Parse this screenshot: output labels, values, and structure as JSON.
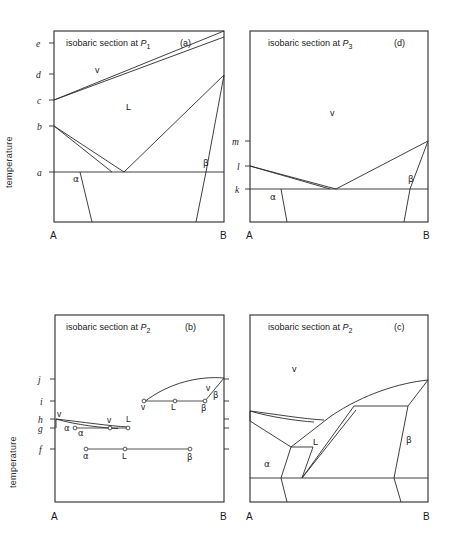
{
  "figure": {
    "axis_label": "temperature",
    "panels": [
      {
        "id": "a",
        "tag": "(a)",
        "title_prefix": "isobaric section at ",
        "title_symbol": "P",
        "title_sub": "1",
        "left_corner": "A",
        "right_corner": "B",
        "ticks": [
          "e",
          "d",
          "c",
          "b",
          "a"
        ],
        "regions": [
          {
            "name": "v"
          },
          {
            "name": "L"
          },
          {
            "name": "α"
          },
          {
            "name": "β"
          }
        ]
      },
      {
        "id": "d",
        "tag": "(d)",
        "title_prefix": "isobaric section at ",
        "title_symbol": "P",
        "title_sub": "3",
        "left_corner": "A",
        "right_corner": "B",
        "ticks": [
          "m",
          "l",
          "k"
        ],
        "regions": [
          {
            "name": "v"
          },
          {
            "name": "α"
          },
          {
            "name": "β"
          }
        ]
      },
      {
        "id": "b",
        "tag": "(b)",
        "title_prefix": "isobaric section at ",
        "title_symbol": "P",
        "title_sub": "2",
        "left_corner": "A",
        "right_corner": "B",
        "ticks": [
          "j",
          "i",
          "h",
          "g",
          "f"
        ],
        "tie_lines": [
          {
            "level": "i",
            "labels": [
              "v",
              "L",
              "β"
            ]
          },
          {
            "level": "g",
            "labels": [
              "α",
              "v",
              "L"
            ]
          },
          {
            "level": "f",
            "labels": [
              "α",
              "L",
              "β"
            ]
          }
        ],
        "regions": [
          {
            "name": "v"
          },
          {
            "name": "β"
          },
          {
            "name": "v"
          },
          {
            "name": "α"
          }
        ]
      },
      {
        "id": "c",
        "tag": "(c)",
        "title_prefix": "isobaric section at ",
        "title_symbol": "P",
        "title_sub": "2",
        "left_corner": "A",
        "right_corner": "B",
        "ticks": [],
        "regions": [
          {
            "name": "v"
          },
          {
            "name": "L"
          },
          {
            "name": "α"
          },
          {
            "name": "β"
          }
        ]
      }
    ]
  }
}
